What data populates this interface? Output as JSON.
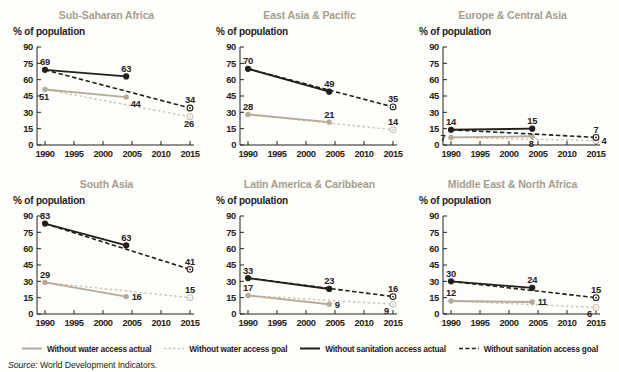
{
  "colors": {
    "black": "#221e1c",
    "tan": "#b3ab9c",
    "tan_light": "#cac4b6",
    "title": "#a49e90",
    "text": "#262220",
    "background": "#fdfdfa"
  },
  "legend": {
    "items": [
      {
        "label": "Without water access actual",
        "color": "tan",
        "dash": false
      },
      {
        "label": "Without water access goal",
        "color": "tan_light",
        "dash": true
      },
      {
        "label": "Without sanitation access actual",
        "color": "black",
        "dash": false
      },
      {
        "label": "Without sanitation access goal",
        "color": "black",
        "dash": true
      }
    ]
  },
  "source": {
    "prefix": "Source:",
    "text": " World Development Indicators."
  },
  "chart_data": [
    {
      "type": "line",
      "title": "Sub-Saharan Africa",
      "ylabel": "% of population",
      "ylim": [
        0,
        90
      ],
      "y_ticks": [
        0,
        15,
        30,
        45,
        60,
        75,
        90
      ],
      "x_ticks": [
        1990,
        1995,
        2000,
        2005,
        2010,
        2015
      ],
      "series": [
        {
          "name": "Without water access actual",
          "color": "tan",
          "dash": false,
          "marker": "filled",
          "x": [
            1990,
            2004
          ],
          "y": [
            51,
            44
          ],
          "labels": [
            {
              "i": 0,
              "pos": "below"
            },
            {
              "i": 1,
              "pos": "below-right"
            }
          ]
        },
        {
          "name": "Without water access goal",
          "color": "tan_light",
          "dash": true,
          "marker": "end-ring",
          "x": [
            1990,
            2015
          ],
          "y": [
            51,
            26
          ],
          "labels": [
            {
              "i": 1,
              "pos": "below"
            }
          ]
        },
        {
          "name": "Without sanitation access actual",
          "color": "black",
          "dash": false,
          "marker": "filled",
          "x": [
            1990,
            2004
          ],
          "y": [
            69,
            63
          ],
          "labels": [
            {
              "i": 0,
              "pos": "above"
            },
            {
              "i": 1,
              "pos": "above"
            }
          ]
        },
        {
          "name": "Without sanitation access goal",
          "color": "black",
          "dash": true,
          "marker": "end-ring",
          "x": [
            1990,
            2015
          ],
          "y": [
            69,
            34
          ],
          "labels": [
            {
              "i": 1,
              "pos": "above"
            }
          ]
        }
      ]
    },
    {
      "type": "line",
      "title": "East Asia & Pacific",
      "ylabel": "% of population",
      "ylim": [
        0,
        90
      ],
      "y_ticks": [
        0,
        15,
        30,
        45,
        60,
        75,
        90
      ],
      "x_ticks": [
        1990,
        1995,
        2000,
        2005,
        2010,
        2015
      ],
      "series": [
        {
          "name": "Without water access actual",
          "color": "tan",
          "dash": false,
          "marker": "filled",
          "x": [
            1990,
            2004
          ],
          "y": [
            28,
            21
          ],
          "labels": [
            {
              "i": 0,
              "pos": "above"
            },
            {
              "i": 1,
              "pos": "above"
            }
          ]
        },
        {
          "name": "Without water access goal",
          "color": "tan_light",
          "dash": true,
          "marker": "end-ring",
          "x": [
            1990,
            2015
          ],
          "y": [
            28,
            14
          ],
          "labels": [
            {
              "i": 1,
              "pos": "above"
            }
          ]
        },
        {
          "name": "Without sanitation access actual",
          "color": "black",
          "dash": false,
          "marker": "filled",
          "x": [
            1990,
            2004
          ],
          "y": [
            70,
            49
          ],
          "labels": [
            {
              "i": 0,
              "pos": "above"
            },
            {
              "i": 1,
              "pos": "above"
            }
          ]
        },
        {
          "name": "Without sanitation access goal",
          "color": "black",
          "dash": true,
          "marker": "end-ring",
          "x": [
            1990,
            2015
          ],
          "y": [
            70,
            35
          ],
          "labels": [
            {
              "i": 1,
              "pos": "above"
            }
          ]
        }
      ]
    },
    {
      "type": "line",
      "title": "Europe & Central Asia",
      "ylabel": "% of population",
      "ylim": [
        0,
        90
      ],
      "y_ticks": [
        0,
        15,
        30,
        45,
        60,
        75,
        90
      ],
      "x_ticks": [
        1990,
        1995,
        2000,
        2005,
        2010,
        2015
      ],
      "series": [
        {
          "name": "Without water access actual",
          "color": "tan",
          "dash": false,
          "marker": "filled",
          "x": [
            1990,
            2004
          ],
          "y": [
            7,
            8
          ],
          "labels": [
            {
              "i": 0,
              "pos": "left"
            },
            {
              "i": 1,
              "pos": "below"
            }
          ]
        },
        {
          "name": "Without water access goal",
          "color": "tan_light",
          "dash": true,
          "marker": "end-ring",
          "x": [
            1990,
            2015
          ],
          "y": [
            7,
            4
          ],
          "labels": [
            {
              "i": 1,
              "pos": "right"
            }
          ]
        },
        {
          "name": "Without sanitation access actual",
          "color": "black",
          "dash": false,
          "marker": "filled",
          "x": [
            1990,
            2004
          ],
          "y": [
            14,
            15
          ],
          "labels": [
            {
              "i": 0,
              "pos": "above"
            },
            {
              "i": 1,
              "pos": "above"
            }
          ]
        },
        {
          "name": "Without sanitation access goal",
          "color": "black",
          "dash": true,
          "marker": "end-ring",
          "x": [
            1990,
            2015
          ],
          "y": [
            14,
            7
          ],
          "labels": [
            {
              "i": 1,
              "pos": "above"
            }
          ]
        }
      ]
    },
    {
      "type": "line",
      "title": "South Asia",
      "ylabel": "% of population",
      "ylim": [
        0,
        90
      ],
      "y_ticks": [
        0,
        15,
        30,
        45,
        60,
        75,
        90
      ],
      "x_ticks": [
        1990,
        1995,
        2000,
        2005,
        2010,
        2015
      ],
      "series": [
        {
          "name": "Without water access actual",
          "color": "tan",
          "dash": false,
          "marker": "filled",
          "x": [
            1990,
            2004
          ],
          "y": [
            29,
            16
          ],
          "labels": [
            {
              "i": 0,
              "pos": "above"
            },
            {
              "i": 1,
              "pos": "right"
            }
          ]
        },
        {
          "name": "Without water access goal",
          "color": "tan_light",
          "dash": true,
          "marker": "end-ring",
          "x": [
            1990,
            2015
          ],
          "y": [
            29,
            15
          ],
          "labels": [
            {
              "i": 1,
              "pos": "above"
            }
          ]
        },
        {
          "name": "Without sanitation access actual",
          "color": "black",
          "dash": false,
          "marker": "filled",
          "x": [
            1990,
            2004
          ],
          "y": [
            83,
            63
          ],
          "labels": [
            {
              "i": 0,
              "pos": "above"
            },
            {
              "i": 1,
              "pos": "above"
            }
          ]
        },
        {
          "name": "Without sanitation access goal",
          "color": "black",
          "dash": true,
          "marker": "end-ring",
          "x": [
            1990,
            2015
          ],
          "y": [
            83,
            41
          ],
          "labels": [
            {
              "i": 1,
              "pos": "above"
            }
          ]
        }
      ]
    },
    {
      "type": "line",
      "title": "Latin America & Caribbean",
      "ylabel": "% of population",
      "ylim": [
        0,
        90
      ],
      "y_ticks": [
        0,
        15,
        30,
        45,
        60,
        75,
        90
      ],
      "x_ticks": [
        1990,
        1995,
        2000,
        2005,
        2010,
        2015
      ],
      "series": [
        {
          "name": "Without water access actual",
          "color": "tan",
          "dash": false,
          "marker": "filled",
          "x": [
            1990,
            2004
          ],
          "y": [
            17,
            9
          ],
          "labels": [
            {
              "i": 0,
              "pos": "above"
            },
            {
              "i": 1,
              "pos": "right"
            }
          ]
        },
        {
          "name": "Without water access goal",
          "color": "tan_light",
          "dash": true,
          "marker": "end-ring",
          "x": [
            1990,
            2015
          ],
          "y": [
            17,
            9
          ],
          "labels": [
            {
              "i": 1,
              "pos": "below-left"
            }
          ]
        },
        {
          "name": "Without sanitation access actual",
          "color": "black",
          "dash": false,
          "marker": "filled",
          "x": [
            1990,
            2004
          ],
          "y": [
            33,
            23
          ],
          "labels": [
            {
              "i": 0,
              "pos": "above"
            },
            {
              "i": 1,
              "pos": "above"
            }
          ]
        },
        {
          "name": "Without sanitation access goal",
          "color": "black",
          "dash": true,
          "marker": "end-ring",
          "x": [
            1990,
            2015
          ],
          "y": [
            33,
            16
          ],
          "labels": [
            {
              "i": 1,
              "pos": "above"
            }
          ]
        }
      ]
    },
    {
      "type": "line",
      "title": "Middle East & North Africa",
      "ylabel": "% of population",
      "ylim": [
        0,
        90
      ],
      "y_ticks": [
        0,
        15,
        30,
        45,
        60,
        75,
        90
      ],
      "x_ticks": [
        1990,
        1995,
        2000,
        2005,
        2010,
        2015
      ],
      "series": [
        {
          "name": "Without water access actual",
          "color": "tan",
          "dash": false,
          "marker": "filled",
          "x": [
            1990,
            2004
          ],
          "y": [
            12,
            11
          ],
          "labels": [
            {
              "i": 0,
              "pos": "above"
            },
            {
              "i": 1,
              "pos": "right"
            }
          ]
        },
        {
          "name": "Without water access goal",
          "color": "tan_light",
          "dash": true,
          "marker": "end-ring",
          "x": [
            1990,
            2015
          ],
          "y": [
            12,
            6
          ],
          "labels": [
            {
              "i": 1,
              "pos": "below-left"
            }
          ]
        },
        {
          "name": "Without sanitation access actual",
          "color": "black",
          "dash": false,
          "marker": "filled",
          "x": [
            1990,
            2004
          ],
          "y": [
            30,
            24
          ],
          "labels": [
            {
              "i": 0,
              "pos": "above"
            },
            {
              "i": 1,
              "pos": "above"
            }
          ]
        },
        {
          "name": "Without sanitation access goal",
          "color": "black",
          "dash": true,
          "marker": "end-ring",
          "x": [
            1990,
            2015
          ],
          "y": [
            30,
            15
          ],
          "labels": [
            {
              "i": 1,
              "pos": "above"
            }
          ]
        }
      ]
    }
  ]
}
